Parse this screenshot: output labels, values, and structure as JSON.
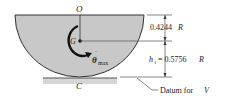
{
  "diagram": {
    "labels": {
      "pivot": "O",
      "center_of_mass": "G",
      "contact": "C",
      "omega_symbol": "θ",
      "omega_sub": "max",
      "upper_dim": "0.4244",
      "upper_dim_unit": "R",
      "h_symbol": "h",
      "h_sub": "1",
      "lower_dim": "= 0.5756",
      "lower_dim_unit": "R",
      "datum": "Datum for ",
      "datum_var": "V"
    },
    "colors": {
      "fill": "#c8c8c8",
      "stroke": "#333333",
      "ground": "#bdbdbd"
    }
  }
}
